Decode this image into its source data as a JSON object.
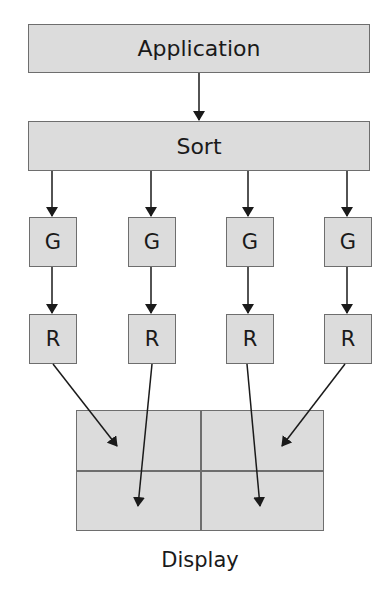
{
  "diagram": {
    "application": "Application",
    "sort": "Sort",
    "geometry_units": [
      "G",
      "G",
      "G",
      "G"
    ],
    "raster_units": [
      "R",
      "R",
      "R",
      "R"
    ],
    "display_label": "Display",
    "display_tiles": 4
  },
  "colors": {
    "box_fill": "#dcdcdc",
    "box_border": "#6e6e6e",
    "arrow": "#1a1a1a"
  }
}
